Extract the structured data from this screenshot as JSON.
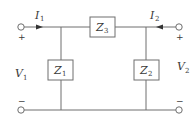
{
  "diagram": {
    "type": "two-port T-network circuit",
    "colors": {
      "wire": "#6e6e6e",
      "text": "#3a3a3a",
      "background": "#ffffff"
    },
    "impedances": [
      {
        "id": "Z1",
        "label": "Z",
        "subscript": "1",
        "position": "left shunt"
      },
      {
        "id": "Z2",
        "label": "Z",
        "subscript": "2",
        "position": "right shunt"
      },
      {
        "id": "Z3",
        "label": "Z",
        "subscript": "3",
        "position": "series top"
      }
    ],
    "currents": [
      {
        "id": "I1",
        "label": "I",
        "subscript": "1",
        "direction": "right"
      },
      {
        "id": "I2",
        "label": "I",
        "subscript": "2",
        "direction": "left"
      }
    ],
    "voltages": [
      {
        "id": "V1",
        "label": "V",
        "subscript": "1"
      },
      {
        "id": "V2",
        "label": "V",
        "subscript": "2"
      }
    ],
    "polarity": {
      "plus": "+",
      "minus": "−"
    }
  }
}
